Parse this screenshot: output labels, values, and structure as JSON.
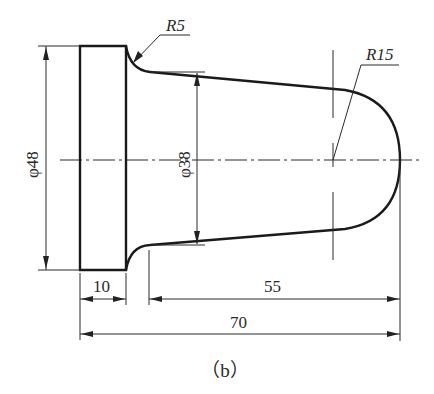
{
  "figure": {
    "caption": "（b）"
  },
  "dimensions": {
    "flange_diameter": "φ48",
    "taper_diameter": "φ38",
    "fillet_radius": "R5",
    "end_radius": "R15",
    "flange_length": "10",
    "taper_length": "55",
    "overall_length": "70"
  },
  "colors": {
    "line": "#1a1a1a",
    "background": "#ffffff"
  }
}
